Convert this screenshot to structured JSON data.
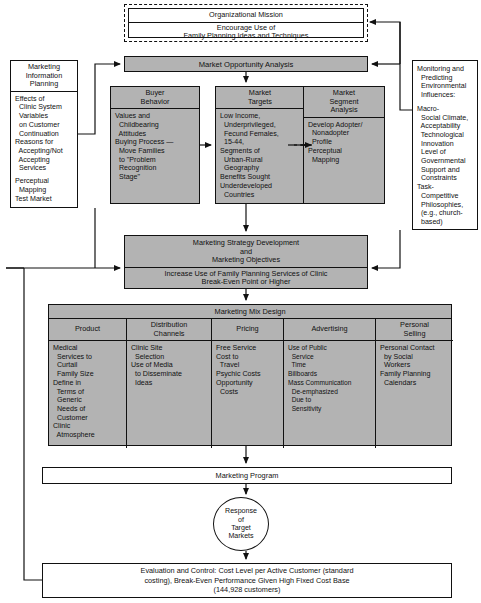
{
  "diagram": {
    "mission": {
      "header": "Organizational Mission",
      "line1": "Encourage Use of",
      "line2": "Family Planning Ideas and Techniques"
    },
    "left_panel": {
      "header_line1": "Marketing",
      "header_line2": "Information",
      "header_line3": "Planning",
      "items": [
        "Effects of",
        "  Clinic System",
        "  Variables",
        "  on Customer",
        "  Continuation",
        "Reasons for",
        "  Accepting/Not",
        "  Accepting",
        "  Services",
        "",
        "Perceptual",
        "  Mapping",
        "Test Market"
      ]
    },
    "right_panel": {
      "header_line1": "Monitoring and",
      "header_line2": "  Predicting",
      "header_line3": "  Environmental",
      "header_line4": "  Influences:",
      "items": [
        "Macro-",
        "  Social Climate,",
        "  Acceptability",
        "  Technological",
        "  Innovation",
        "  Level of",
        "  Governmental",
        "  Support and",
        "  Constraints",
        "Task-",
        "  Competitive",
        "  Philosophies,",
        "  (e.g., church-",
        "  based)"
      ]
    },
    "market_opportunity": {
      "label": "Market Opportunity Analysis"
    },
    "buyer_behavior": {
      "header_line1": "Buyer",
      "header_line2": "Behavior",
      "items": [
        "Values and",
        "  Childbearing",
        "  Attitudes",
        "Buying Process —",
        "  Move Families",
        "  to \"Problem",
        "  Recognition",
        "  Stage\""
      ]
    },
    "market_targets": {
      "header_line1": "Market",
      "header_line2": "Targets",
      "items": [
        "Low Income,",
        "  Underprivileged,",
        "  Fecund Females,",
        "  15-44,",
        "Segments of",
        "  Urban-Rural",
        "  Geography",
        "Benefits Sought",
        "Underdeveloped",
        "  Countries"
      ]
    },
    "market_segment": {
      "header_line1": "Market",
      "header_line2": "Segment",
      "header_line3": "Analysis",
      "items": [
        "Develop Adopter/",
        "  Nonadopter",
        "  Profile",
        "Perceptual",
        "  Mapping"
      ]
    },
    "strategy": {
      "line1": "Marketing Strategy Development",
      "line2": "and",
      "line3": "Marketing Objectives",
      "obj_line1": "Increase Use of Family Planning Services of Clinic",
      "obj_line2": "Break-Even Point or Higher"
    },
    "mix": {
      "title": "Marketing Mix Design",
      "columns": [
        {
          "header_line1": "Product",
          "header_line2": "",
          "items": [
            "Medical",
            "  Services to",
            "  Curtail",
            "  Family Size",
            "Define in",
            "  Terms of",
            "  Generic",
            "  Needs of",
            "  Customer",
            "Clinic",
            "  Atmosphere"
          ]
        },
        {
          "header_line1": "Distribution",
          "header_line2": "Channels",
          "items": [
            "Clinic Site",
            "  Selection",
            "Use of Media",
            "  to Disseminate",
            "  Ideas"
          ]
        },
        {
          "header_line1": "Pricing",
          "header_line2": "",
          "items": [
            "Free Service",
            "Cost to",
            "  Travel",
            "Psychic Costs",
            "Opportunity",
            "  Costs"
          ]
        },
        {
          "header_line1": "Advertising",
          "header_line2": "",
          "items": [
            "Use of Public",
            "  Service",
            "  Time",
            "Billboards",
            "Mass Communication",
            "  De-emphasized",
            "  Due to",
            "  Sensitivity"
          ]
        },
        {
          "header_line1": "Personal",
          "header_line2": "Selling",
          "items": [
            "Personal Contact",
            "  by Social",
            "  Workers",
            "Family Planning",
            "  Calendars"
          ]
        }
      ]
    },
    "marketing_program": {
      "label": "Marketing Program"
    },
    "response": {
      "line1": "Response",
      "line2": "of",
      "line3": "Target",
      "line4": "Markets"
    },
    "evaluation": {
      "line1": "Evaluation and Control: Cost Level per Active Customer (standard",
      "line2": "costing), Break-Even Performance Given High Fixed Cost Base",
      "line3": "(144,928 customers)"
    },
    "colors": {
      "fill_gray": "#b3b3b3",
      "stroke": "#111111",
      "background": "#ffffff"
    }
  }
}
